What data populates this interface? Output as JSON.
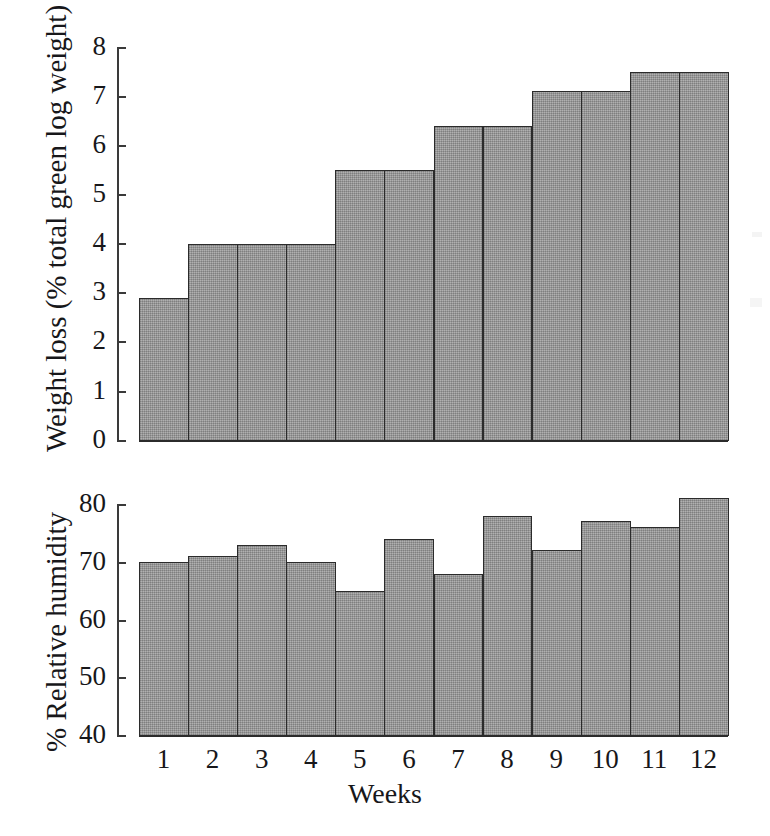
{
  "figure": {
    "background_color": "#ffffff",
    "bar_fill_color": "#9d9d9d",
    "bar_edge_color": "#2b2b2b",
    "axis_color": "#3a3a3a",
    "text_color": "#17171a"
  },
  "chart_data": [
    {
      "type": "bar",
      "panel": "top",
      "title": "",
      "xlabel": "",
      "ylabel": "Weight loss (% total green log weight)",
      "categories": [
        "1",
        "2",
        "3",
        "4",
        "5",
        "6",
        "7",
        "8",
        "9",
        "10",
        "11",
        "12"
      ],
      "values": [
        2.9,
        4.0,
        4.0,
        4.0,
        5.5,
        5.5,
        6.4,
        6.4,
        7.1,
        7.1,
        7.5,
        7.5
      ],
      "ylim": [
        0,
        8
      ],
      "yticks": [
        0,
        1,
        2,
        3,
        4,
        5,
        6,
        7,
        8
      ],
      "ytick_labels": [
        "0",
        "1",
        "2",
        "3",
        "4",
        "5",
        "6",
        "7",
        "8"
      ],
      "grid": false,
      "legend": false
    },
    {
      "type": "bar",
      "panel": "bottom",
      "title": "",
      "xlabel": "Weeks",
      "ylabel": "% Relative humidity",
      "categories": [
        "1",
        "2",
        "3",
        "4",
        "5",
        "6",
        "7",
        "8",
        "9",
        "10",
        "11",
        "12"
      ],
      "values": [
        70,
        71,
        73,
        70,
        65,
        74,
        68,
        78,
        72,
        77,
        76,
        81
      ],
      "ylim": [
        40,
        80
      ],
      "yticks": [
        40,
        50,
        60,
        70,
        80
      ],
      "ytick_labels": [
        "40",
        "50",
        "60",
        "70",
        "80"
      ],
      "grid": false,
      "legend": false
    }
  ],
  "top_panel": {
    "ylabel": "Weight loss (% total green log weight)",
    "ytick_labels": [
      "8",
      "7",
      "6",
      "5",
      "4",
      "3",
      "2",
      "1",
      "0"
    ]
  },
  "bottom_panel": {
    "ylabel": "% Relative humidity",
    "ytick_labels": [
      "80",
      "70",
      "60",
      "50",
      "40"
    ],
    "xtick_labels": [
      "1",
      "2",
      "3",
      "4",
      "5",
      "6",
      "7",
      "8",
      "9",
      "10",
      "11",
      "12"
    ],
    "xlabel": "Weeks"
  }
}
